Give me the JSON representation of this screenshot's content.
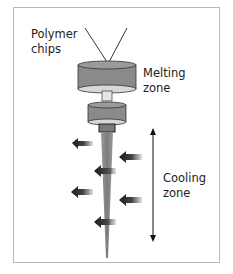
{
  "diagram": {
    "labels": {
      "polymer_line1": "Polymer",
      "polymer_line2": "chips",
      "melting_line1": "Melting",
      "melting_line2": "zone",
      "cooling_line1": "Cooling",
      "cooling_line2": "zone"
    },
    "colors": {
      "cylinder": "#8a8a8a",
      "cylinder_top": "#9a9a9a",
      "cylinder_bottom": "#d8d8d8",
      "fibre": "#8c8c8c",
      "arrow": "#222222",
      "frame": "#b8b8b8",
      "text": "#222222"
    }
  }
}
